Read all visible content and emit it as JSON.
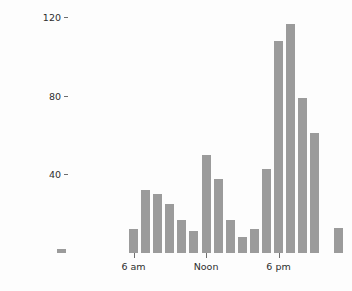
{
  "chart_data": {
    "type": "bar",
    "title": "",
    "subtitle": "",
    "xlabel": "",
    "ylabel": "Frequency",
    "grid": false,
    "legend": null,
    "ylim": [
      0,
      125
    ],
    "yticks": [
      40,
      80,
      120
    ],
    "ytick_labels": [
      "40",
      "80",
      "120"
    ],
    "xtick_positions": [
      6,
      12,
      18
    ],
    "xtick_labels": [
      "6 am",
      "Noon",
      "6 pm"
    ],
    "categories": [
      "0",
      "1",
      "2",
      "3",
      "4",
      "5",
      "6",
      "7",
      "8",
      "9",
      "10",
      "11",
      "12",
      "13",
      "14",
      "15",
      "16",
      "17",
      "18",
      "19",
      "20",
      "21",
      "22",
      "23"
    ],
    "values": [
      2,
      0,
      0,
      0,
      0,
      0,
      12,
      32,
      30,
      25,
      17,
      11,
      50,
      38,
      17,
      8,
      12,
      43,
      108,
      117,
      79,
      61,
      0,
      13
    ],
    "bar_color": "#9b9b9b",
    "background_color": "#fdfdfd",
    "axis_text_color": "#2e2e2e"
  },
  "axis": {
    "y_title": "Frequency"
  }
}
